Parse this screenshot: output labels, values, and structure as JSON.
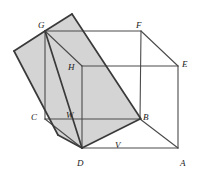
{
  "figure": {
    "kind": "geometry-diagram",
    "background_color": "#ffffff",
    "shade_fill": "#d4d4d4",
    "line_color": "#4a4a4a",
    "heavy_line_color": "#3a3a3a",
    "label_color": "#1a1a1a",
    "labels": [
      {
        "id": "label-G",
        "text": "G",
        "x": 38,
        "y": 21
      },
      {
        "id": "label-F",
        "text": "F",
        "x": 136,
        "y": 21
      },
      {
        "id": "label-E",
        "text": "E",
        "x": 182,
        "y": 60
      },
      {
        "id": "label-H",
        "text": "H",
        "x": 68,
        "y": 63
      },
      {
        "id": "label-C",
        "text": "C",
        "x": 31,
        "y": 113
      },
      {
        "id": "label-W",
        "text": "W",
        "x": 66,
        "y": 111
      },
      {
        "id": "label-B",
        "text": "B",
        "x": 143,
        "y": 113
      },
      {
        "id": "label-V",
        "text": "V",
        "x": 115,
        "y": 141
      },
      {
        "id": "label-D",
        "text": "D",
        "x": 77,
        "y": 159
      },
      {
        "id": "label-A",
        "text": "A",
        "x": 180,
        "y": 159
      }
    ],
    "vertices": {
      "G": [
        45,
        31
      ],
      "F": [
        141,
        31
      ],
      "E": [
        178,
        66
      ],
      "H": [
        82,
        66
      ],
      "C": [
        45,
        119
      ],
      "W": [
        82,
        119
      ],
      "B": [
        140,
        119
      ],
      "D": [
        82,
        148
      ],
      "A": [
        178,
        148
      ],
      "plane_apex": [
        72,
        14
      ],
      "plane_left": [
        14,
        51
      ],
      "plane_lower_left": [
        58,
        135
      ]
    },
    "shaded_polygon": "72,14 141,119 82,148 58,135 14,51 45,31",
    "cube_edges": [
      {
        "name": "edge-G-F",
        "points": "45,31 141,31"
      },
      {
        "name": "edge-F-E",
        "points": "141,31 178,66"
      },
      {
        "name": "edge-F-B",
        "points": "141,31 140,119"
      },
      {
        "name": "edge-E-A",
        "points": "178,66 178,148"
      },
      {
        "name": "edge-H-E",
        "points": "82,66 178,66"
      },
      {
        "name": "edge-G-C",
        "points": "45,31 45,119"
      },
      {
        "name": "edge-G-H",
        "points": "45,31 82,66"
      },
      {
        "name": "edge-H-W",
        "points": "82,66 82,148"
      },
      {
        "name": "edge-C-B",
        "points": "45,119 140,119"
      },
      {
        "name": "edge-C-D",
        "points": "45,119 82,148"
      },
      {
        "name": "edge-D-A",
        "points": "82,148 178,148"
      },
      {
        "name": "edge-B-A",
        "points": "140,119 178,148"
      }
    ],
    "section_edges": [
      {
        "name": "section-edge-apex-G",
        "points": "72,14 45,31"
      },
      {
        "name": "section-edge-apex-B",
        "points": "72,14 141,119"
      },
      {
        "name": "section-edge-G-left",
        "points": "45,31 14,51"
      },
      {
        "name": "section-edge-left-lowerleft",
        "points": "14,51 58,135"
      },
      {
        "name": "section-edge-lowerleft-D",
        "points": "58,135 82,148"
      },
      {
        "name": "section-edge-D-B",
        "points": "82,148 140,119"
      },
      {
        "name": "section-edge-G-D",
        "points": "45,31 82,148"
      }
    ]
  }
}
